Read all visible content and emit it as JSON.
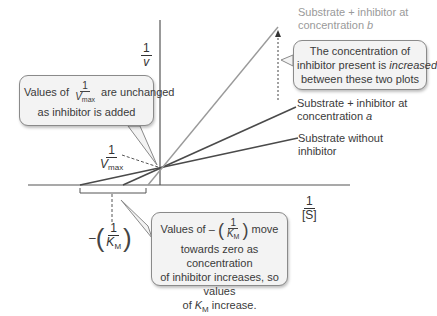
{
  "diagram": {
    "type": "Lineweaver-Burk plot (competitive inhibition)",
    "axes": {
      "y_label": {
        "numerator": "1",
        "denominator": "v"
      },
      "x_label": {
        "numerator": "1",
        "denominator": "[S]"
      }
    },
    "intercepts": {
      "y_intercept": {
        "numerator": "1",
        "denominator_main": "V",
        "denominator_sub": "max"
      },
      "x_intercept": {
        "prefix": "–",
        "numerator": "1",
        "denominator_main": "K",
        "denominator_sub": "M"
      }
    },
    "lines": [
      {
        "label_line1": "Substrate + inhibitor at",
        "label_line2": "concentration ",
        "label_var": "b",
        "color": "#9a9a9a"
      },
      {
        "label_line1": "Substrate + inhibitor at",
        "label_line2": "concentration ",
        "label_var": "a",
        "color": "#4a4a4a"
      },
      {
        "label_line1": "Substrate without",
        "label_line2": "inhibitor",
        "label_var": "",
        "color": "#4a4a4a"
      }
    ],
    "callouts": {
      "vmax": {
        "prefix": "Values of",
        "frac_num": "1",
        "frac_den_main": "V",
        "frac_den_sub": "max",
        "suffix": "are unchanged",
        "line2": "as inhibitor is added"
      },
      "concentration": {
        "line1": "The concentration of",
        "line2_pre": "inhibitor present is ",
        "line2_em": "increased",
        "line3": "between these two plots"
      },
      "km": {
        "prefix": "Values of –",
        "frac_num": "1",
        "frac_den_main": "K",
        "frac_den_sub": "M",
        "suffix": "move",
        "line2": "towards zero as concentration",
        "line3": "of inhibitor increases, so values",
        "line4_pre": "of ",
        "line4_var": "K",
        "line4_sub": "M",
        "line4_post": " increase."
      }
    },
    "colors": {
      "axis": "#555555",
      "line_dark": "#4a4a4a",
      "line_light": "#9a9a9a",
      "callout_bg": "#f3f3f3",
      "callout_border": "#8a8a8a"
    }
  }
}
